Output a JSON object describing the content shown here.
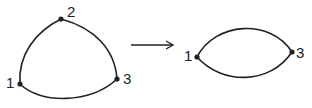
{
  "left_graph": {
    "nodes": [
      {
        "id": "1",
        "label": "1"
      },
      {
        "id": "2",
        "label": "2"
      },
      {
        "id": "3",
        "label": "3"
      }
    ],
    "edges": [
      [
        "2",
        "1"
      ],
      [
        "2",
        "3"
      ],
      [
        "1",
        "3"
      ]
    ]
  },
  "arrow": {
    "direction": "right"
  },
  "right_graph": {
    "nodes": [
      {
        "id": "1",
        "label": "1"
      },
      {
        "id": "3",
        "label": "3"
      }
    ],
    "edges": [
      [
        "1",
        "3"
      ],
      [
        "1",
        "3"
      ]
    ]
  },
  "colors": {
    "stroke": "#222222",
    "background": "#ffffff"
  }
}
